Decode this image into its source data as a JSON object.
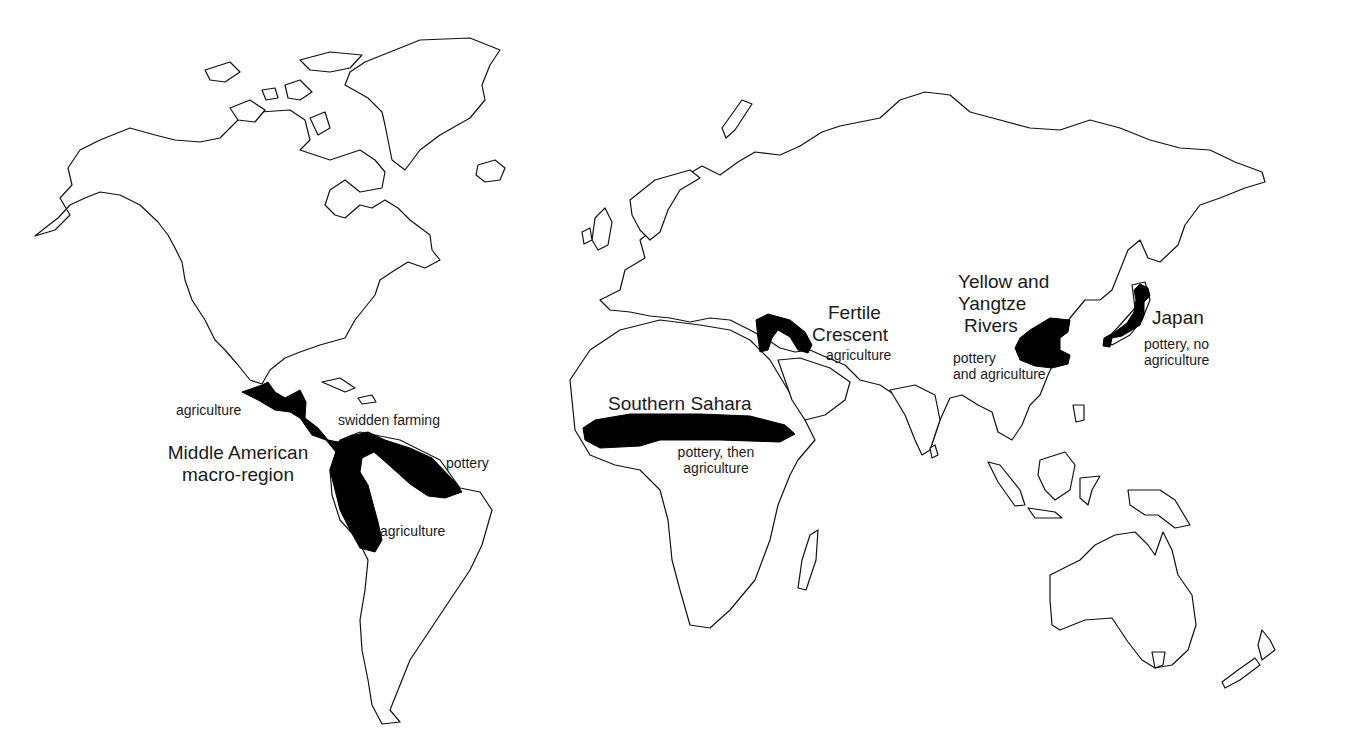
{
  "map": {
    "type": "world outline map",
    "regions": [
      {
        "id": "middle-america",
        "name": "Middle American macro-region",
        "name_lines": [
          "Middle American",
          "macro-region"
        ],
        "annotations": {
          "mexico": "agriculture",
          "caribbean_coast": "swidden farming",
          "amazon_north": "pottery",
          "andes": "agriculture"
        }
      },
      {
        "id": "southern-sahara",
        "name": "Southern Sahara",
        "note_lines": [
          "pottery, then",
          "agriculture"
        ]
      },
      {
        "id": "fertile-crescent",
        "name": "Fertile Crescent",
        "name_lines": [
          "Fertile",
          "Crescent"
        ],
        "note": "agriculture"
      },
      {
        "id": "yellow-yangtze",
        "name": "Yellow and Yangtze Rivers",
        "name_lines": [
          "Yellow and",
          "Yangtze",
          "Rivers"
        ],
        "note_lines": [
          "pottery",
          "and agriculture"
        ]
      },
      {
        "id": "japan",
        "name": "Japan",
        "note_lines": [
          "pottery, no",
          "agriculture"
        ]
      }
    ],
    "colors": {
      "background": "#ffffff",
      "outline": "#111111",
      "highlight_fill": "#000000",
      "text": "#1a1a1a"
    }
  }
}
